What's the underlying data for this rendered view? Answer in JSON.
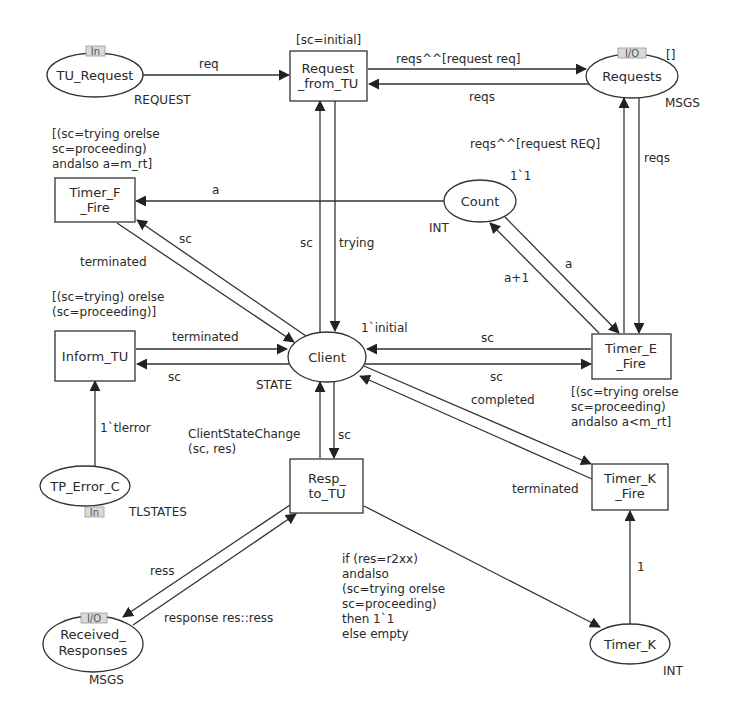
{
  "diagram": {
    "type": "coloured-petri-net",
    "places": {
      "tu_request": {
        "name": "TU_Request",
        "colorset": "REQUEST",
        "port_tag": "In"
      },
      "requests": {
        "name": "Requests",
        "colorset": "MSGS",
        "port_tag": "I/O",
        "initial_marking": "[]"
      },
      "count": {
        "name": "Count",
        "colorset": "INT",
        "initial_marking": "1`1"
      },
      "client": {
        "name": "Client",
        "colorset": "STATE",
        "initial_marking": "1`initial"
      },
      "tp_error_c": {
        "name": "TP_Error_C",
        "colorset": "TLSTATES",
        "port_tag": "In"
      },
      "received_responses": {
        "name_line1": "Received_",
        "name_line2": "Responses",
        "colorset": "MSGS",
        "port_tag": "I/O"
      },
      "timer_k": {
        "name": "Timer_K",
        "colorset": "INT"
      }
    },
    "transitions": {
      "request_from_tu": {
        "line1": "Request",
        "line2": "_from_TU",
        "guard": "[sc=initial]"
      },
      "timer_f_fire": {
        "line1": "Timer_F",
        "line2": "_Fire",
        "guard": [
          "[(sc=trying orelse",
          "sc=proceeding)",
          "andalso a=m_rt]"
        ]
      },
      "inform_tu": {
        "line1": "Inform_TU",
        "guard": [
          "[(sc=trying) orelse",
          "(sc=proceeding)]"
        ]
      },
      "timer_e_fire": {
        "line1": "Timer_E",
        "line2": "_Fire",
        "guard": [
          "[(sc=trying orelse",
          "sc=proceeding)",
          "andalso a<m_rt]"
        ]
      },
      "resp_to_tu": {
        "line1": "Resp_",
        "line2": "to_TU"
      },
      "timer_k_fire": {
        "line1": "Timer_K",
        "line2": "_Fire"
      }
    },
    "arcs": {
      "tu_request_to_request_from_tu": "req",
      "request_from_tu_to_requests": "reqs^^[request req]",
      "requests_to_request_from_tu": "reqs",
      "timer_e_fire_to_requests": "reqs^^[request REQ]",
      "requests_to_timer_e_fire": "reqs",
      "count_to_timer_f_fire": "a",
      "count_to_timer_e_fire": "a",
      "timer_e_fire_to_count": "a+1",
      "client_to_timer_f_fire": "sc",
      "timer_f_fire_to_client": "terminated",
      "client_to_request_from_tu": "sc",
      "request_from_tu_to_client": "trying",
      "inform_tu_to_client": "terminated",
      "client_to_inform_tu": "sc",
      "tp_error_c_to_inform_tu": "1`tlerror",
      "timer_e_fire_to_client": "sc",
      "client_to_timer_e_fire": "sc",
      "client_to_timer_k_fire": "completed",
      "timer_k_fire_to_client": "terminated",
      "client_to_resp_to_tu": "sc",
      "resp_to_tu_to_client": [
        "ClientStateChange",
        "(sc, res)"
      ],
      "resp_to_tu_to_timer_k": [
        "if (res=r2xx)",
        "andalso",
        "(sc=trying orelse",
        "sc=proceeding)",
        "then 1`1",
        "else empty"
      ],
      "timer_k_to_timer_k_fire": "1",
      "resp_to_tu_to_received_responses": "ress",
      "received_responses_to_resp_to_tu": "response res::ress"
    }
  }
}
